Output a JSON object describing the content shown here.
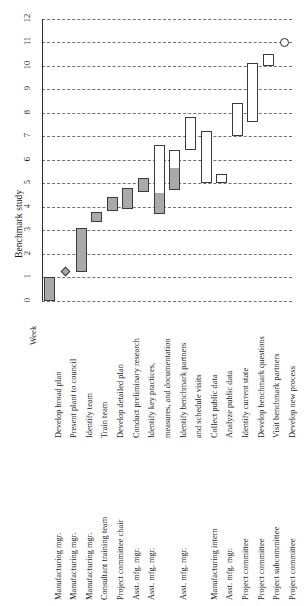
{
  "chart_data": {
    "type": "bar",
    "title": "Benchmark study",
    "xlabel": "",
    "ylabel": "Week",
    "ylim": [
      0,
      12
    ],
    "yticks": [
      0,
      1,
      2,
      3,
      4,
      5,
      6,
      7,
      8,
      9,
      10,
      11,
      12
    ],
    "grid": true,
    "legend": "",
    "categories": [
      "Develop broad plan",
      "Present plant to council",
      "Identify team",
      "Train team",
      "Develop detailed plan",
      "Conduct preliminary research",
      "Identify key practices,",
      "measures, and documentation",
      "Identify benchmark partners",
      "and schedule visits",
      "Collect public data",
      "Analyze public data",
      "Identify current state",
      "Develop benchmark questions",
      "Visit benchmark partners",
      "Develop new process",
      "Finalize new process",
      "to council"
    ],
    "tasks": [
      {
        "task": "Develop broad plan",
        "resource": "Manufacturing mgr.",
        "start": 0,
        "end": 1,
        "progress": 1,
        "shape": "bar"
      },
      {
        "task": "Present plant to council",
        "resource": "Manufacturing mgr.",
        "start": 1.25,
        "end": 1.25,
        "progress": 1,
        "shape": "diamond"
      },
      {
        "task": "Identify team",
        "resource": "Manufacturing mgr.",
        "start": 1.2,
        "end": 3.1,
        "progress": 1,
        "shape": "bar"
      },
      {
        "task": "Train team",
        "resource": "Consultant training team",
        "start": 3.35,
        "end": 3.75,
        "progress": 1,
        "shape": "bar"
      },
      {
        "task": "Develop detailed plan",
        "resource": "Project committee chair",
        "start": 3.8,
        "end": 4.4,
        "progress": 1,
        "shape": "bar"
      },
      {
        "task": "Conduct preliminary research",
        "resource": "Asst. mfg. mgr.",
        "start": 3.9,
        "end": 4.8,
        "progress": 1,
        "shape": "bar"
      },
      {
        "task": "Identify key practices, measures, and documentation",
        "resource": "Asst. mfg. mgr.",
        "start": 4.6,
        "end": 5.2,
        "progress": 1,
        "shape": "bar"
      },
      {
        "task": "Identify benchmark partners and schedule visits",
        "resource": "Asst. mfg. mgr.",
        "start": 3.7,
        "end": 6.6,
        "progress": 0.3,
        "shape": "bar"
      },
      {
        "task": "Collect public data",
        "resource": "Manufacturing intern",
        "start": 4.7,
        "end": 6.4,
        "progress": 0.55,
        "shape": "bar"
      },
      {
        "task": "Analyze public data",
        "resource": "Asst. mfg. mgr.",
        "start": 6.4,
        "end": 7.8,
        "progress": 0,
        "shape": "bar"
      },
      {
        "task": "Identify current state",
        "resource": "Project committee",
        "start": 5.0,
        "end": 7.2,
        "progress": 0,
        "shape": "bar"
      },
      {
        "task": "Develop benchmark questions",
        "resource": "Project committee",
        "start": 5.0,
        "end": 5.4,
        "progress": 0,
        "shape": "bar"
      },
      {
        "task": "Visit benchmark partners",
        "resource": "Project subcommittee",
        "start": 7.0,
        "end": 8.4,
        "progress": 0,
        "shape": "bar"
      },
      {
        "task": "Develop new process",
        "resource": "Project committee",
        "start": 7.6,
        "end": 10.1,
        "progress": 0,
        "shape": "bar"
      },
      {
        "task": "Finalize new process",
        "resource": "Project committee",
        "start": 10.0,
        "end": 10.5,
        "progress": 0,
        "shape": "bar"
      },
      {
        "task": "to council",
        "resource": "Project committee",
        "start": 11.0,
        "end": 11.0,
        "progress": 0,
        "shape": "circle"
      }
    ],
    "task_labels": [
      {
        "text": "Develop broad plan",
        "row": 0
      },
      {
        "text": "Present plant to council",
        "row": 1
      },
      {
        "text": "Identify team",
        "row": 2
      },
      {
        "text": "Train team",
        "row": 3
      },
      {
        "text": "Develop detailed plan",
        "row": 4
      },
      {
        "text": "Conduct preliminary research",
        "row": 5
      },
      {
        "text": "Identify key practices,",
        "row": 6
      },
      {
        "text": "measures, and documentation",
        "row": 7
      },
      {
        "text": "Identify benchmark partners",
        "row": 8
      },
      {
        "text": "and schedule visits",
        "row": 9
      },
      {
        "text": "Collect public data",
        "row": 10
      },
      {
        "text": "Analyze public data",
        "row": 11
      },
      {
        "text": "Identify current state",
        "row": 12
      },
      {
        "text": "Develop benchmark questions",
        "row": 13
      },
      {
        "text": "Visit benchmark partners",
        "row": 14
      },
      {
        "text": "Develop new process",
        "row": 15
      },
      {
        "text": "Finalize new process",
        "row": 16
      },
      {
        "text": "to council",
        "row": 17
      }
    ],
    "resources": [
      {
        "text": "Manufacturing mgr.",
        "row": 0
      },
      {
        "text": "Manufacturing mgr.",
        "row": 1
      },
      {
        "text": "Manufacturing mgr.",
        "row": 2
      },
      {
        "text": "Consultant training team",
        "row": 3
      },
      {
        "text": "Project committee chair",
        "row": 4
      },
      {
        "text": "Asst. mfg. mgr.",
        "row": 5
      },
      {
        "text": "Asst. mfg. mgr.",
        "row": 6
      },
      {
        "text": "Asst. mfg. mgr.",
        "row": 8
      },
      {
        "text": "Manufacturing intern",
        "row": 10
      },
      {
        "text": "Asst. mfg. mgr.",
        "row": 11
      },
      {
        "text": "Project committee",
        "row": 12
      },
      {
        "text": "Project committee",
        "row": 13
      },
      {
        "text": "Project subcommittee",
        "row": 14
      },
      {
        "text": "Project committee",
        "row": 15
      },
      {
        "text": "Project committee",
        "row": 16
      }
    ],
    "colors": {
      "complete": "#a9a9a9",
      "incomplete": "#ffffff",
      "outline": "#3b3b3b",
      "grid": "#5a5a5a",
      "text": "#1a1a1a"
    }
  },
  "axis": {
    "week_word": "Week",
    "title": "Benchmark study"
  }
}
